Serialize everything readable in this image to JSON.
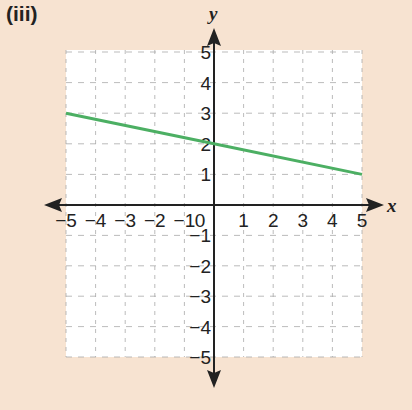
{
  "figure": {
    "label": "(iii)"
  },
  "chart_data": {
    "type": "line",
    "title": "",
    "xlabel": "x",
    "ylabel": "y",
    "xlim": [
      -5,
      5
    ],
    "ylim": [
      -5,
      5
    ],
    "grid": true,
    "x_ticks": [
      "-5",
      "-4",
      "-3",
      "-2",
      "-1",
      "0",
      "1",
      "2",
      "3",
      "4",
      "5"
    ],
    "y_ticks": [
      "-5",
      "-4",
      "-3",
      "-2",
      "-1",
      "1",
      "2",
      "3",
      "4",
      "5"
    ],
    "series": [
      {
        "name": "line",
        "color": "#4caf63",
        "x": [
          -5,
          0,
          5
        ],
        "y": [
          3,
          2,
          1
        ]
      }
    ]
  },
  "colors": {
    "background": "#f7e3d1",
    "plot_area": "#ffffff",
    "line": "#4caf63"
  }
}
